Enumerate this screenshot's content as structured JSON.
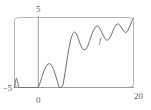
{
  "chart_data": {
    "type": "line",
    "title": "",
    "subtitle": "",
    "xlabel": "",
    "ylabel": "",
    "xlim": [
      -5,
      20
    ],
    "ylim": [
      -5,
      5
    ],
    "grid": false,
    "legend": null,
    "axis_ticks": {
      "x": [
        {
          "value": 0,
          "label": "0"
        },
        {
          "value": 20,
          "label": "20"
        }
      ],
      "y": [
        {
          "value": -5,
          "label": "−5"
        },
        {
          "value": 5,
          "label": "5"
        }
      ]
    },
    "annotations": [
      {
        "text": "f",
        "x": 13.0,
        "y": 1.35,
        "style": "italic"
      }
    ],
    "series": [
      {
        "name": "f",
        "color": "#6e6e70",
        "description": "Oscillating curve with growing amplitude, clipped below at the axis floor",
        "x": [
          -5.0,
          -4.8,
          -4.6,
          -4.4,
          -4.2,
          -4.0,
          -3.5,
          -3.0,
          -2.5,
          -2.0,
          -1.5,
          -1.0,
          -0.5,
          0.0,
          0.4,
          0.8,
          1.2,
          1.6,
          2.0,
          2.4,
          2.8,
          3.2,
          3.6,
          4.0,
          4.4,
          4.8,
          5.2,
          5.6,
          6.0,
          6.4,
          6.8,
          7.2,
          7.6,
          8.0,
          8.4,
          8.8,
          9.2,
          9.6,
          10.0,
          10.4,
          10.8,
          11.2,
          11.6,
          12.0,
          12.4,
          12.8,
          13.2,
          13.6,
          14.0,
          14.4,
          14.8,
          15.2,
          15.6,
          16.0,
          16.4,
          16.8,
          17.2,
          17.6,
          18.0,
          18.4,
          18.8,
          19.2,
          19.6,
          20.0
        ],
        "y": [
          -5.0,
          -4.1,
          -3.7,
          -4.0,
          -4.7,
          -5.0,
          -5.0,
          -5.0,
          -5.0,
          -5.0,
          -5.0,
          -5.0,
          -5.0,
          -5.0,
          -4.3,
          -3.4,
          -2.6,
          -2.0,
          -1.65,
          -1.6,
          -1.85,
          -2.4,
          -3.2,
          -4.1,
          -5.0,
          -5.0,
          -4.6,
          -3.0,
          -1.2,
          0.45,
          1.8,
          2.65,
          2.95,
          2.7,
          2.0,
          1.2,
          0.6,
          0.35,
          0.45,
          0.95,
          1.7,
          2.5,
          3.2,
          3.65,
          3.8,
          3.6,
          3.1,
          2.5,
          2.0,
          1.75,
          1.85,
          2.3,
          2.95,
          3.6,
          4.0,
          4.1,
          3.85,
          3.4,
          3.0,
          2.85,
          3.1,
          3.7,
          4.4,
          4.95
        ]
      }
    ]
  },
  "figure": {
    "frame_color": "#b6b6b8",
    "curve_color": "#6e6e70",
    "axis_color": "#9a9a9c",
    "background": "#ffffff"
  },
  "labels": {
    "y_top": "5",
    "y_bottom": "−5",
    "x_left": "0",
    "x_right": "20",
    "curve": "f"
  }
}
